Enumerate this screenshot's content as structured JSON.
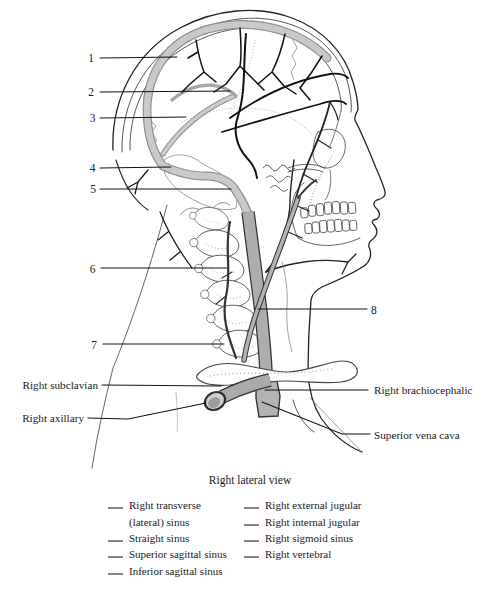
{
  "figure": {
    "caption": "Right lateral view",
    "callout_numbers": [
      "1",
      "2",
      "3",
      "4",
      "5",
      "6",
      "7",
      "8"
    ],
    "side_labels": {
      "right_subclavian": "Right subclavian",
      "right_axillary": "Right axillary",
      "right_brachiocephalic": "Right brachiocephalic",
      "superior_vena_cava": "Superior vena cava"
    }
  },
  "legend": {
    "left_column": [
      {
        "label_line1": "Right transverse",
        "label_line2": "(lateral) sinus"
      },
      {
        "label_line1": "Straight sinus"
      },
      {
        "label_line1": "Superior sagittal sinus"
      },
      {
        "label_line1": "Inferior sagittal sinus"
      }
    ],
    "right_column": [
      {
        "label_line1": "Right external jugular"
      },
      {
        "label_line1": "Right internal jugular"
      },
      {
        "label_line1": "Right sigmoid sinus"
      },
      {
        "label_line1": "Right vertebral"
      }
    ]
  },
  "colors": {
    "ink": "#1a1a1a",
    "vein_gray": "#adadad",
    "sinus_gray": "#c9c9c9",
    "bone_white": "#ffffff",
    "paper": "#ffffff"
  }
}
